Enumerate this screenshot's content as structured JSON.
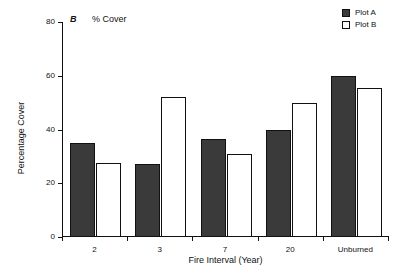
{
  "panel": {
    "label": "B",
    "subtitle": "% Cover"
  },
  "legend": {
    "items": [
      {
        "label": "Plot A",
        "swatch": "filled",
        "color": "#3a3a3a"
      },
      {
        "label": "Plot B",
        "swatch": "open",
        "color": "#ffffff"
      }
    ]
  },
  "axes": {
    "y_tick_labels": [
      "0",
      "20",
      "40",
      "60",
      "80"
    ],
    "x_tick_labels": [
      "2",
      "3",
      "7",
      "20",
      "Unburned"
    ]
  },
  "chart_data": {
    "type": "bar",
    "title": "% Cover",
    "panel_label": "B",
    "categories": [
      "2",
      "3",
      "7",
      "20",
      "Unburned"
    ],
    "series": [
      {
        "name": "Plot A",
        "values": [
          35,
          27,
          36.5,
          40,
          60
        ],
        "fill": "#3a3a3a"
      },
      {
        "name": "Plot B",
        "values": [
          27.5,
          52,
          31,
          50,
          55.5
        ],
        "fill": "#ffffff"
      }
    ],
    "xlabel": "Fire Interval (Year)",
    "ylabel": "Percentage Cover",
    "ylim": [
      0,
      80
    ],
    "yticks": [
      0,
      20,
      40,
      60,
      80
    ],
    "grid": false,
    "legend_position": "top-right"
  }
}
